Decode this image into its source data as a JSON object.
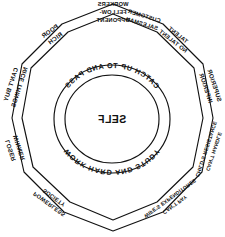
{
  "diagram": {
    "type": "concentric-ring-decagon",
    "orientation": "mirrored-horizontally",
    "background_color": "#ffffff",
    "ink_color": "#111111",
    "center": {
      "label": "SELF"
    },
    "inner_ring": {
      "top_arc_text": "CATCH UP TO AND PASS",
      "bottom_arc_text": "WORK HARD AND STUDY"
    },
    "outer_ring": {
      "shape": "decagon",
      "sides": 10,
      "segments": [
        {
          "position": "top",
          "angle_deg": 0,
          "outer_label": "OPPONENT",
          "inner_label": "FELLOW-",
          "inner_label_2": "WORKERS"
        },
        {
          "position": "upper-right",
          "angle_deg": 36,
          "outer_label": "RICH",
          "inner_label": "POOR"
        },
        {
          "position": "right",
          "angle_deg": 72,
          "outer_label": "NICE THINGS",
          "inner_label": "CAN'T BUY"
        },
        {
          "position": "lower-right",
          "angle_deg": 108,
          "outer_label": "WINNER",
          "inner_label": "LOSER"
        },
        {
          "position": "bottom-right",
          "angle_deg": 144,
          "outer_label": "SOCIETY",
          "inner_label": "POWERLESS"
        },
        {
          "position": "bottom-left",
          "angle_deg": 216,
          "outer_label": "WIFE'S EXPENDITURES",
          "inner_label": "CAN'T PAY"
        },
        {
          "position": "lower-left",
          "angle_deg": 252,
          "outer_label": "CHILD'S RESISTANCE",
          "inner_label": "CAN'T HANDLE"
        },
        {
          "position": "left",
          "angle_deg": 288,
          "outer_label": "INFERIOR",
          "inner_label": "SUPERIOR"
        },
        {
          "position": "upper-left",
          "angle_deg": 324,
          "outer_label": "NO TALENT",
          "inner_label": "TALENT"
        },
        {
          "position": "top-left",
          "angle_deg": 340,
          "outer_label": "SALESMAN",
          "inner_label": "CUSTOMER"
        }
      ]
    }
  }
}
